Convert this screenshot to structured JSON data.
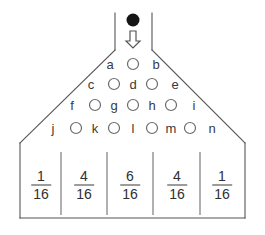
{
  "diagram": {
    "ball": {
      "name": "ball",
      "color": "#151515",
      "cx": 133,
      "cy": 20,
      "r": 6.5
    },
    "arrow": {
      "name": "down-arrow",
      "color": "#555555",
      "cx": 133,
      "top": 31,
      "bottom": 48
    },
    "outline_color": "#555555",
    "peg_color": "#6b6b6b",
    "funnel": {
      "left_x": 115,
      "right_x": 152,
      "top_y": 13,
      "split_y": 50
    },
    "pegs": [
      {
        "id": "p1",
        "cx": 133,
        "cy": 64,
        "r": 5.5
      },
      {
        "id": "p2",
        "cx": 114,
        "cy": 84,
        "r": 5.5
      },
      {
        "id": "p3",
        "cx": 152,
        "cy": 84,
        "r": 5.5
      },
      {
        "id": "p4",
        "cx": 95,
        "cy": 105,
        "r": 5.5
      },
      {
        "id": "p5",
        "cx": 133,
        "cy": 105,
        "r": 5.5
      },
      {
        "id": "p6",
        "cx": 171,
        "cy": 105,
        "r": 5.5
      },
      {
        "id": "p7",
        "cx": 76,
        "cy": 128,
        "r": 5.5
      },
      {
        "id": "p8",
        "cx": 114,
        "cy": 128,
        "r": 5.5
      },
      {
        "id": "p9",
        "cx": 152,
        "cy": 128,
        "r": 5.5
      },
      {
        "id": "p10",
        "cx": 190,
        "cy": 128,
        "r": 5.5
      }
    ],
    "peg_labels": [
      {
        "id": "a",
        "text": "a",
        "x": 110,
        "y": 64
      },
      {
        "id": "b",
        "text": "b",
        "x": 156,
        "y": 64
      },
      {
        "id": "c",
        "text": "c",
        "x": 91,
        "y": 84
      },
      {
        "id": "d",
        "text": "d",
        "x": 133,
        "y": 84
      },
      {
        "id": "e",
        "text": "e",
        "x": 175,
        "y": 84
      },
      {
        "id": "f",
        "text": "f",
        "x": 72,
        "y": 105
      },
      {
        "id": "g",
        "text": "g",
        "x": 114,
        "y": 105
      },
      {
        "id": "h",
        "text": "h",
        "x": 152,
        "y": 105
      },
      {
        "id": "i",
        "text": "i",
        "x": 194,
        "y": 105
      },
      {
        "id": "j",
        "text": "j",
        "x": 53,
        "y": 128
      },
      {
        "id": "k",
        "text": "k",
        "x": 95,
        "y": 128
      },
      {
        "id": "l",
        "text": "l",
        "x": 133,
        "y": 128
      },
      {
        "id": "m",
        "text": "m",
        "x": 171,
        "y": 128
      },
      {
        "id": "n",
        "text": "n",
        "x": 212,
        "y": 128
      }
    ],
    "hopper": {
      "left_slope": {
        "x1": 115,
        "y1": 50,
        "x2": 20,
        "y2": 143
      },
      "right_slope": {
        "x1": 152,
        "y1": 50,
        "x2": 245,
        "y2": 143
      },
      "left_wall": {
        "x": 20,
        "y1": 143,
        "y2": 218
      },
      "right_wall": {
        "x": 245,
        "y1": 143,
        "y2": 218
      },
      "bottom": {
        "x1": 20,
        "y1": 218,
        "x2": 245,
        "y2": 218
      }
    },
    "bin_dividers": [
      {
        "x": 61,
        "y1": 152,
        "y2": 215
      },
      {
        "x": 107,
        "y1": 152,
        "y2": 215
      },
      {
        "x": 153,
        "y1": 152,
        "y2": 215
      },
      {
        "x": 200,
        "y1": 152,
        "y2": 215
      }
    ],
    "bins": [
      {
        "id": "bin-1",
        "numerator": "1",
        "denominator": "16",
        "cx": 41,
        "cy": 185
      },
      {
        "id": "bin-2",
        "numerator": "4",
        "denominator": "16",
        "cx": 84,
        "cy": 185
      },
      {
        "id": "bin-3",
        "numerator": "6",
        "denominator": "16",
        "cx": 130,
        "cy": 185
      },
      {
        "id": "bin-4",
        "numerator": "4",
        "denominator": "16",
        "cx": 177,
        "cy": 185
      },
      {
        "id": "bin-5",
        "numerator": "1",
        "denominator": "16",
        "cx": 222,
        "cy": 185
      }
    ]
  }
}
